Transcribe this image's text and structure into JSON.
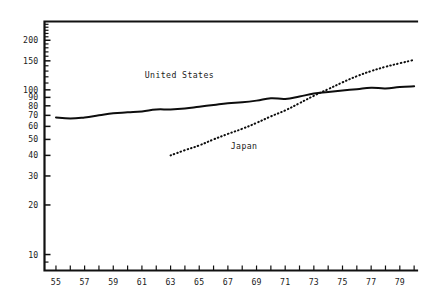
{
  "chart_data": {
    "type": "line",
    "title": "",
    "subtitle": "",
    "xlabel": "",
    "ylabel": "",
    "yscale": "log",
    "ylim": [
      8,
      260
    ],
    "xlim": [
      54.2,
      80.2
    ],
    "grid": false,
    "legend_position": "inline-annotation",
    "y_ticks_labeled": [
      {
        "value": 200,
        "label": "200"
      },
      {
        "value": 150,
        "label": "150"
      },
      {
        "value": 100,
        "label": "100"
      },
      {
        "value": 90,
        "label": "90"
      },
      {
        "value": 80,
        "label": "80"
      },
      {
        "value": 70,
        "label": "70"
      },
      {
        "value": 60,
        "label": "60"
      },
      {
        "value": 50,
        "label": "50"
      },
      {
        "value": 40,
        "label": "40"
      },
      {
        "value": 30,
        "label": "30"
      },
      {
        "value": 20,
        "label": "20"
      },
      {
        "value": 10,
        "label": "10"
      }
    ],
    "y_ticks_minor": [
      110,
      120,
      130,
      140,
      160,
      170,
      180,
      190,
      210,
      220,
      230,
      240,
      250,
      9
    ],
    "x_ticks_all": [
      55,
      56,
      57,
      58,
      59,
      60,
      61,
      62,
      63,
      64,
      65,
      66,
      67,
      68,
      69,
      70,
      71,
      72,
      73,
      74,
      75,
      76,
      77,
      78,
      79,
      80
    ],
    "x_tick_labels": [
      {
        "value": 55,
        "label": "55"
      },
      {
        "value": 57,
        "label": "57"
      },
      {
        "value": 59,
        "label": "59"
      },
      {
        "value": 61,
        "label": "61"
      },
      {
        "value": 63,
        "label": "63"
      },
      {
        "value": 65,
        "label": "65"
      },
      {
        "value": 67,
        "label": "67"
      },
      {
        "value": 69,
        "label": "69"
      },
      {
        "value": 71,
        "label": "71"
      },
      {
        "value": 73,
        "label": "73"
      },
      {
        "value": 75,
        "label": "75"
      },
      {
        "value": 77,
        "label": "77"
      },
      {
        "value": 79,
        "label": "79"
      }
    ],
    "series": [
      {
        "name": "United States",
        "style": "solid",
        "color": "#0d0d0d",
        "annotation": {
          "text": "United States",
          "x": 61.2,
          "y": 118
        },
        "x": [
          55,
          56,
          57,
          58,
          59,
          60,
          61,
          62,
          63,
          64,
          65,
          66,
          67,
          68,
          69,
          70,
          71,
          72,
          73,
          74,
          75,
          76,
          77,
          78,
          79,
          80
        ],
        "values": [
          68,
          67,
          68,
          70,
          72,
          73,
          74,
          76,
          76,
          77,
          79,
          81,
          83,
          84,
          86,
          89,
          88,
          91,
          95,
          97,
          99,
          101,
          103,
          102,
          104,
          105
        ]
      },
      {
        "name": "Japan",
        "style": "dotted",
        "color": "#0d0d0d",
        "annotation": {
          "text": "Japan",
          "x": 67.2,
          "y": 44
        },
        "x": [
          63,
          64,
          65,
          66,
          67,
          68,
          69,
          70,
          71,
          72,
          73,
          74,
          75,
          76,
          77,
          78,
          79,
          80
        ],
        "values": [
          40,
          43,
          46,
          50,
          54,
          58,
          63,
          69,
          75,
          83,
          92,
          101,
          111,
          121,
          130,
          138,
          145,
          152
        ]
      }
    ]
  }
}
